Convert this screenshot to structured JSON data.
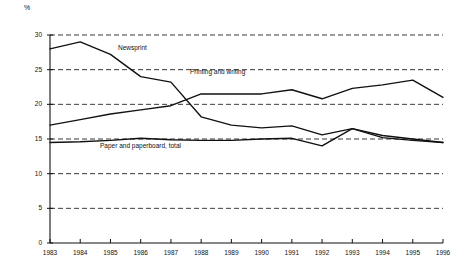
{
  "chart_data": {
    "type": "line",
    "title": "",
    "subtitle": "",
    "xlabel": "",
    "ylabel": "%",
    "ylim": [
      0,
      30
    ],
    "yticks": [
      0,
      5,
      10,
      15,
      20,
      25,
      30
    ],
    "grid": true,
    "grid_style": "dashed-horizontal",
    "legend_position": "inline-annotations",
    "categories": [
      "1983",
      "1984",
      "1985",
      "1986",
      "1987",
      "1988",
      "1989",
      "1990",
      "1991",
      "1992",
      "1993",
      "1994",
      "1995",
      "1996"
    ],
    "x": [
      1983,
      1984,
      1985,
      1986,
      1987,
      1988,
      1989,
      1990,
      1991,
      1992,
      1993,
      1994,
      1995,
      1996
    ],
    "series": [
      {
        "name": "Newsprint",
        "values": [
          28.0,
          29.0,
          27.2,
          24.0,
          23.2,
          18.2,
          17.0,
          16.6,
          16.9,
          15.6,
          16.5,
          15.5,
          15.0,
          14.5
        ]
      },
      {
        "name": "Printing and writing",
        "values": [
          17.0,
          17.8,
          18.6,
          19.2,
          19.8,
          21.5,
          21.5,
          21.5,
          22.1,
          20.8,
          22.3,
          22.8,
          23.5,
          21.0
        ]
      },
      {
        "name": "Paper and paperboard, total",
        "values": [
          14.5,
          14.6,
          14.8,
          15.1,
          14.9,
          14.8,
          14.8,
          15.0,
          15.1,
          14.0,
          16.5,
          15.2,
          14.8,
          14.5
        ]
      }
    ],
    "annotations": [
      {
        "text": "Newsprint",
        "series": "Newsprint"
      },
      {
        "text": "Printing and writing",
        "series": "Printing and writing"
      },
      {
        "text": "Paper and paperboard, total",
        "series": "Paper and paperboard, total"
      }
    ],
    "colors": {
      "line": "#111111",
      "grid": "#222222",
      "axis": "#111111",
      "background": "#ffffff"
    }
  }
}
